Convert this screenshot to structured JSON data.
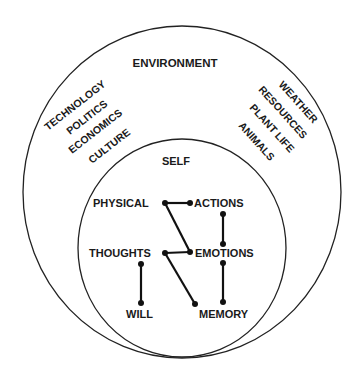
{
  "diagram": {
    "outer_label": "ENVIRONMENT",
    "inner_label": "SELF",
    "left_environment_items": [
      "TECHNOLOGY",
      "POLITICS",
      "ECONOMICS",
      "CULTURE"
    ],
    "right_environment_items": [
      "WEATHER",
      "RESOURCES",
      "PLANT LIFE",
      "ANIMALS"
    ],
    "nodes": {
      "physical": "PHYSICAL",
      "actions": "ACTIONS",
      "thoughts": "THOUGHTS",
      "emotions": "EMOTIONS",
      "will": "WILL",
      "memory": "MEMORY"
    },
    "edges": [
      [
        "PHYSICAL",
        "ACTIONS"
      ],
      [
        "PHYSICAL",
        "EMOTIONS"
      ],
      [
        "ACTIONS",
        "EMOTIONS"
      ],
      [
        "THOUGHTS",
        "EMOTIONS"
      ],
      [
        "THOUGHTS",
        "WILL"
      ],
      [
        "THOUGHTS",
        "MEMORY"
      ],
      [
        "EMOTIONS",
        "MEMORY"
      ]
    ],
    "colors": {
      "ink": "#1a1a1a",
      "background": "#ffffff"
    }
  }
}
